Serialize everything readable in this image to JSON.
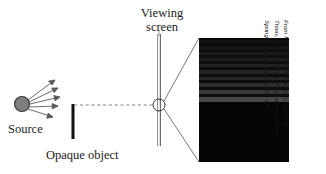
{
  "figure": {
    "background_color": "#ffffff",
    "ink_color": "#1a1a1a"
  },
  "labels": {
    "viewing_screen": "Viewing screen",
    "source": "Source",
    "opaque_object": "Opaque object"
  },
  "credit": {
    "line1": "From M. Cagnet, M. Françon, and J. C.",
    "line2": "Thierr, Atlas of Optical Phenomena, Berlin,",
    "line3": "Springer-Verlag, 1962, plate 32",
    "full": "From M. Cagnet, M. Françon, and J. C. Thierr, Atlas of Optical Phenomena, Berlin, Springer-Verlag, 1962, plate 32"
  },
  "source": {
    "color": "#7d7d7d",
    "outline_color": "#3a3a3a",
    "cx": 22,
    "cy": 104,
    "r": 7.5,
    "ray_count": 5
  },
  "opaque_object": {
    "color": "#111111",
    "x": 72,
    "y_top": 104,
    "y_bottom": 139,
    "width": 3
  },
  "viewing_screen": {
    "color": "#555555",
    "x": 159,
    "y_top": 34,
    "y_bottom": 146
  },
  "edge_marker": {
    "cx": 159,
    "cy": 105,
    "r": 6,
    "stroke": "#333333"
  },
  "photo": {
    "x": 199,
    "y": 38,
    "width": 90,
    "height": 124,
    "background": "#050505",
    "description": "magnified photograph of straight-edge diffraction fringes"
  },
  "chart_data": {
    "type": "heatmap",
    "xlabel": "",
    "ylabel": "position across screen",
    "grid": false,
    "legend": "none",
    "note": "Rows are horizontal fringes in the photograph; value = relative brightness 0-100. Below the geometric shadow edge the field is uniformly dark.",
    "shadow_edge_row_fraction": 0.52,
    "rows": [
      {
        "top_pct": 0.0,
        "height_pct": 1.6,
        "brightness": 2
      },
      {
        "top_pct": 1.6,
        "height_pct": 2.4,
        "brightness": 7
      },
      {
        "top_pct": 4.0,
        "height_pct": 2.4,
        "brightness": 4
      },
      {
        "top_pct": 6.4,
        "height_pct": 2.4,
        "brightness": 9
      },
      {
        "top_pct": 8.8,
        "height_pct": 2.4,
        "brightness": 5
      },
      {
        "top_pct": 11.2,
        "height_pct": 2.4,
        "brightness": 11
      },
      {
        "top_pct": 13.6,
        "height_pct": 2.4,
        "brightness": 5
      },
      {
        "top_pct": 16.0,
        "height_pct": 2.4,
        "brightness": 12
      },
      {
        "top_pct": 18.4,
        "height_pct": 2.4,
        "brightness": 5
      },
      {
        "top_pct": 20.8,
        "height_pct": 2.8,
        "brightness": 14
      },
      {
        "top_pct": 23.6,
        "height_pct": 2.4,
        "brightness": 5
      },
      {
        "top_pct": 26.0,
        "height_pct": 2.8,
        "brightness": 16
      },
      {
        "top_pct": 28.8,
        "height_pct": 2.4,
        "brightness": 5
      },
      {
        "top_pct": 31.2,
        "height_pct": 2.8,
        "brightness": 18
      },
      {
        "top_pct": 34.0,
        "height_pct": 2.4,
        "brightness": 5
      },
      {
        "top_pct": 36.4,
        "height_pct": 3.0,
        "brightness": 21
      },
      {
        "top_pct": 39.4,
        "height_pct": 2.4,
        "brightness": 5
      },
      {
        "top_pct": 41.8,
        "height_pct": 3.2,
        "brightness": 26
      },
      {
        "top_pct": 45.0,
        "height_pct": 2.6,
        "brightness": 5
      },
      {
        "top_pct": 47.6,
        "height_pct": 4.4,
        "brightness": 34
      },
      {
        "top_pct": 52.0,
        "height_pct": 48.0,
        "brightness": 1
      }
    ]
  }
}
